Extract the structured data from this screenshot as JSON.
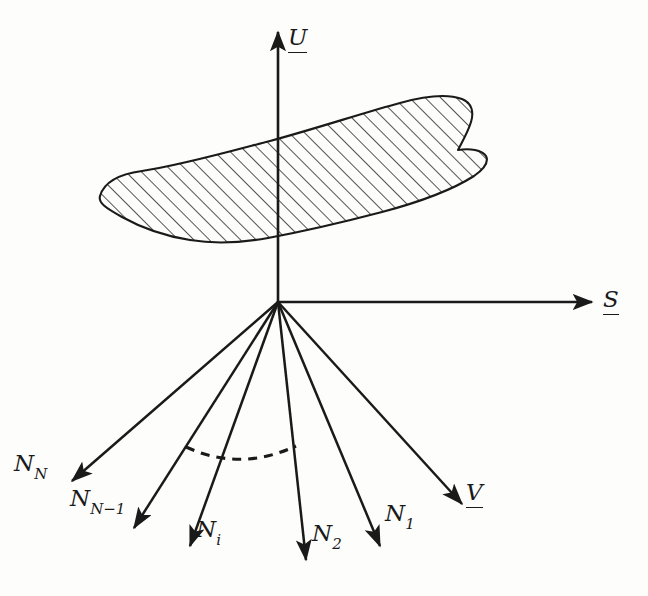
{
  "figure": {
    "kind": "vector-diagram",
    "background_color": "#fdfdfc",
    "stroke_color": "#1a1a1a",
    "canvas": {
      "width": 648,
      "height": 596
    },
    "origin": {
      "x": 278,
      "y": 302
    }
  },
  "axes": [
    {
      "id": "u-axis",
      "label": "U",
      "underlined": true,
      "direction": "up",
      "from": {
        "x": 278,
        "y": 302
      },
      "to": {
        "x": 278,
        "y": 32
      },
      "label_pos": {
        "x": 288,
        "y": 26
      }
    },
    {
      "id": "s-axis",
      "label": "S",
      "underlined": true,
      "direction": "right",
      "from": {
        "x": 278,
        "y": 302
      },
      "to": {
        "x": 592,
        "y": 302
      },
      "label_pos": {
        "x": 603,
        "y": 288
      }
    }
  ],
  "vectors": [
    {
      "id": "n-N",
      "label": "N",
      "sub": "N",
      "underlined": false,
      "from": {
        "x": 278,
        "y": 302
      },
      "to": {
        "x": 72,
        "y": 481
      },
      "label_pos": {
        "x": 14,
        "y": 452
      }
    },
    {
      "id": "n-N-minus-1",
      "label": "N",
      "sub": "N−1",
      "underlined": false,
      "from": {
        "x": 278,
        "y": 302
      },
      "to": {
        "x": 134,
        "y": 528
      },
      "label_pos": {
        "x": 70,
        "y": 487
      }
    },
    {
      "id": "n-i",
      "label": "N",
      "sub": "i",
      "underlined": false,
      "from": {
        "x": 278,
        "y": 302
      },
      "to": {
        "x": 190,
        "y": 546
      },
      "label_pos": {
        "x": 196,
        "y": 518
      }
    },
    {
      "id": "n-2",
      "label": "N",
      "sub": "2",
      "underlined": false,
      "from": {
        "x": 278,
        "y": 302
      },
      "to": {
        "x": 306,
        "y": 560
      },
      "label_pos": {
        "x": 312,
        "y": 522
      }
    },
    {
      "id": "n-1",
      "label": "N",
      "sub": "1",
      "underlined": false,
      "from": {
        "x": 278,
        "y": 302
      },
      "to": {
        "x": 380,
        "y": 546
      },
      "label_pos": {
        "x": 385,
        "y": 502
      }
    },
    {
      "id": "v-vector",
      "label": "V",
      "sub": "",
      "underlined": true,
      "from": {
        "x": 278,
        "y": 302
      },
      "to": {
        "x": 462,
        "y": 504
      },
      "label_pos": {
        "x": 466,
        "y": 481
      }
    }
  ],
  "arc": {
    "id": "cone-arc",
    "style": "dashed",
    "dash_pattern": "9 7",
    "path": "M 186 447 Q 240 472 296 446"
  },
  "hatched_region": {
    "id": "tangent-plane-patch",
    "fill": "none",
    "hatch_angle_deg": 45,
    "hatch_spacing_px": 11,
    "outline_path": "M 100 196 C 104 182 120 174 142 171 C 178 166 228 152 270 141 C 318 128 366 112 400 103 C 425 96 448 94 462 99 C 472 103 474 112 471 122 C 468 132 462 142 458 150 C 470 148 482 150 486 156 C 489 162 484 169 474 176 C 452 190 416 203 382 212 C 340 223 300 232 268 238 C 240 243 214 244 190 240 C 164 236 140 227 122 217 C 106 208 98 203 100 196 Z"
  }
}
